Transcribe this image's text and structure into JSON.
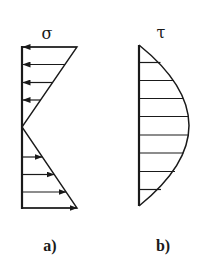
{
  "figure": {
    "panels": [
      {
        "id": "a",
        "caption": "a)",
        "symbol": "σ",
        "description": "Linear normal stress distribution, tension/compression reversing at neutral axis",
        "arrows_top": 4,
        "arrows_bottom": 4
      },
      {
        "id": "b",
        "caption": "b)",
        "symbol": "τ",
        "description": "Parabolic shear stress distribution",
        "hatch_lines": 8
      }
    ],
    "colors": {
      "stroke": "#1a1a1a",
      "background": "#ffffff"
    }
  }
}
